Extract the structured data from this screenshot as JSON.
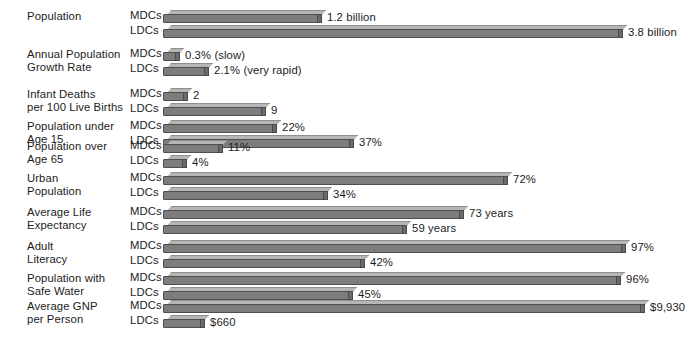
{
  "chart_data": {
    "type": "bar",
    "title": "",
    "subtitle": "",
    "xlabel": "",
    "ylabel": "",
    "orientation": "horizontal",
    "grid": false,
    "legend_position": "inline-left",
    "group_labels": [
      "MDCs",
      "LDCs"
    ],
    "categories": [
      "Population",
      "Annual Population\nGrowth Rate",
      "Infant Deaths\nper 100 Live Births",
      "Population under\nAge 15",
      "Population over\nAge 65",
      "Urban\nPopulation",
      "Average Life\nExpectancy",
      "Adult\nLiteracy",
      "Population with\nSafe Water",
      "Average GNP\nper Person"
    ],
    "rows": [
      {
        "category": "Population",
        "category_line1": "Population",
        "category_line2": "",
        "bars": [
          {
            "group": "MDCs",
            "value": 1.2,
            "unit": "billion",
            "label": "1.2 billion",
            "length_px": 155
          },
          {
            "group": "LDCs",
            "value": 3.8,
            "unit": "billion",
            "label": "3.8 billion",
            "length_px": 456
          }
        ]
      },
      {
        "category": "Annual Population Growth Rate",
        "category_line1": "Annual Population",
        "category_line2": "Growth Rate",
        "bars": [
          {
            "group": "MDCs",
            "value": 0.3,
            "unit": "%",
            "label": "0.3% (slow)",
            "length_px": 13
          },
          {
            "group": "LDCs",
            "value": 2.1,
            "unit": "%",
            "label": "2.1% (very rapid)",
            "length_px": 42
          }
        ]
      },
      {
        "category": "Infant Deaths per 100 Live Births",
        "category_line1": "Infant Deaths",
        "category_line2": "per 100 Live Births",
        "bars": [
          {
            "group": "MDCs",
            "value": 2,
            "unit": "",
            "label": "2",
            "length_px": 21
          },
          {
            "group": "LDCs",
            "value": 9,
            "unit": "",
            "label": "9",
            "length_px": 99
          }
        ]
      },
      {
        "category": "Population under Age 15",
        "category_line1": "Population under",
        "category_line2": "Age 15",
        "bars": [
          {
            "group": "MDCs",
            "value": 22,
            "unit": "%",
            "label": "22%",
            "length_px": 110
          },
          {
            "group": "LDCs",
            "value": 37,
            "unit": "%",
            "label": "37%",
            "length_px": 187
          }
        ]
      },
      {
        "category": "Population over Age 65",
        "category_line1": "Population over",
        "category_line2": "Age 65",
        "bars": [
          {
            "group": "MDCs",
            "value": 11,
            "unit": "%",
            "label": "11%",
            "length_px": 56
          },
          {
            "group": "LDCs",
            "value": 4,
            "unit": "%",
            "label": "4%",
            "length_px": 20
          }
        ]
      },
      {
        "category": "Urban Population",
        "category_line1": "Urban",
        "category_line2": "Population",
        "bars": [
          {
            "group": "MDCs",
            "value": 72,
            "unit": "%",
            "label": "72%",
            "length_px": 341
          },
          {
            "group": "LDCs",
            "value": 34,
            "unit": "%",
            "label": "34%",
            "length_px": 161
          }
        ]
      },
      {
        "category": "Average Life Expectancy",
        "category_line1": "Average Life",
        "category_line2": "Expectancy",
        "bars": [
          {
            "group": "MDCs",
            "value": 73,
            "unit": "years",
            "label": "73 years",
            "length_px": 297
          },
          {
            "group": "LDCs",
            "value": 59,
            "unit": "years",
            "label": "59 years",
            "length_px": 240
          }
        ]
      },
      {
        "category": "Adult Literacy",
        "category_line1": "Adult",
        "category_line2": "Literacy",
        "bars": [
          {
            "group": "MDCs",
            "value": 97,
            "unit": "%",
            "label": "97%",
            "length_px": 459
          },
          {
            "group": "LDCs",
            "value": 42,
            "unit": "%",
            "label": "42%",
            "length_px": 198
          }
        ]
      },
      {
        "category": "Population with Safe Water",
        "category_line1": "Population with",
        "category_line2": "Safe Water",
        "bars": [
          {
            "group": "MDCs",
            "value": 96,
            "unit": "%",
            "label": "96%",
            "length_px": 454
          },
          {
            "group": "LDCs",
            "value": 45,
            "unit": "%",
            "label": "45%",
            "length_px": 186
          }
        ]
      },
      {
        "category": "Average GNP per Person",
        "category_line1": "Average GNP",
        "category_line2": "per Person",
        "bars": [
          {
            "group": "MDCs",
            "value": 9930,
            "unit": "$",
            "label": "$9,930",
            "length_px": 478
          },
          {
            "group": "LDCs",
            "value": 660,
            "unit": "$",
            "label": "$660",
            "length_px": 38
          }
        ]
      }
    ]
  },
  "colors": {
    "bar_front": "#7d7d7d",
    "bar_top": "#b6b6b6",
    "bar_outline": "#4f4f4f",
    "text": "#1c1c1c",
    "background": "#ffffff"
  }
}
